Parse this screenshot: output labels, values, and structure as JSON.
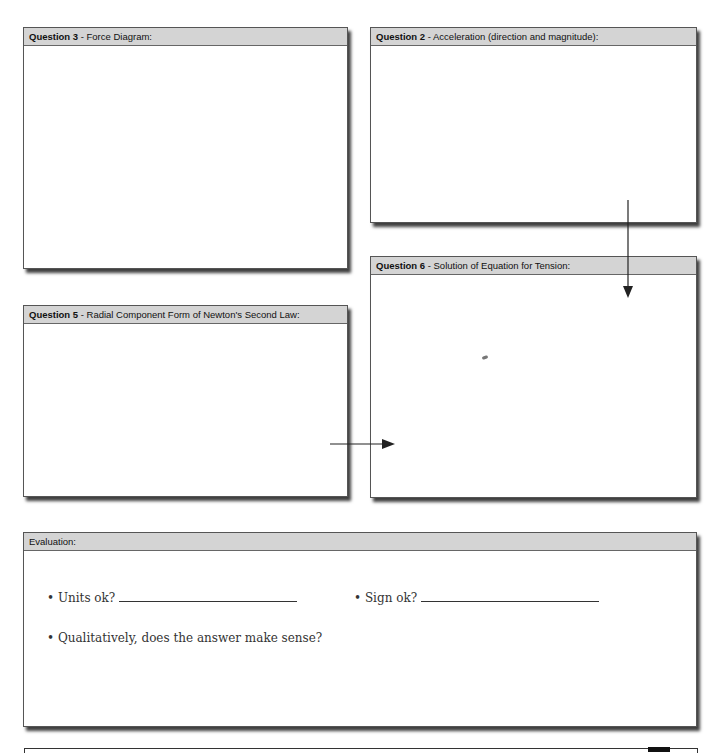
{
  "boxes": {
    "q3": {
      "label_bold": "Question 3",
      "label_rest": " - Force Diagram:"
    },
    "q2": {
      "label_bold": "Question 2",
      "label_rest": " - Acceleration (direction and magnitude):"
    },
    "q6": {
      "label_bold": "Question 6",
      "label_rest": " - Solution of Equation for Tension:"
    },
    "q5": {
      "label_bold": "Question 5",
      "label_rest": " - Radial Component Form of Newton's Second Law:"
    },
    "evaluation": {
      "label": "Evaluation:",
      "items": [
        {
          "text": "• Units ok?"
        },
        {
          "text": "• Sign ok?"
        },
        {
          "text": "• Qualitatively, does the answer make sense?"
        }
      ]
    }
  },
  "arrows": [
    {
      "from": "q2",
      "to": "q6",
      "direction": "down"
    },
    {
      "from": "q5",
      "to": "q6",
      "direction": "right"
    }
  ]
}
